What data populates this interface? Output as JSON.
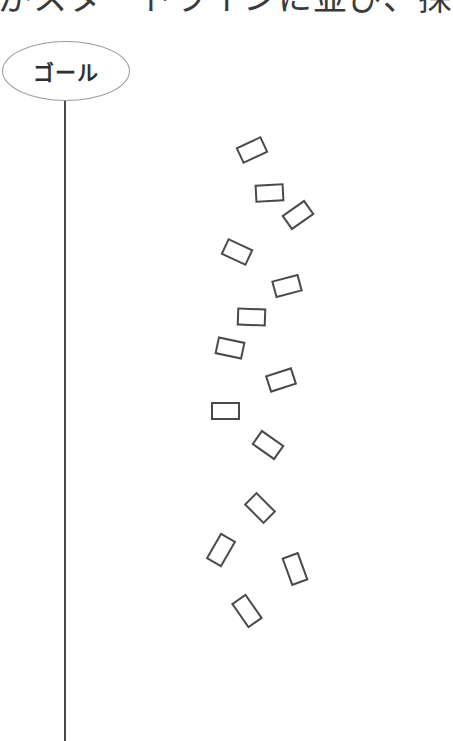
{
  "heading": {
    "text": "がスタートラインに並び、探"
  },
  "goal": {
    "label": "ゴール"
  },
  "colors": {
    "stroke": "#4a4a4a",
    "ellipse_stroke": "#9a9a9a",
    "text": "#2f2f2f"
  },
  "cards": [
    {
      "cx": 252,
      "cy": 150,
      "w": 28,
      "h": 18,
      "rot": -25
    },
    {
      "cx": 269,
      "cy": 193,
      "w": 29,
      "h": 18,
      "rot": -3
    },
    {
      "cx": 298,
      "cy": 215,
      "w": 28,
      "h": 18,
      "rot": -35
    },
    {
      "cx": 237,
      "cy": 252,
      "w": 28,
      "h": 18,
      "rot": 25
    },
    {
      "cx": 287,
      "cy": 286,
      "w": 28,
      "h": 18,
      "rot": -15
    },
    {
      "cx": 251,
      "cy": 317,
      "w": 29,
      "h": 18,
      "rot": 2
    },
    {
      "cx": 230,
      "cy": 348,
      "w": 28,
      "h": 18,
      "rot": 12
    },
    {
      "cx": 281,
      "cy": 380,
      "w": 28,
      "h": 18,
      "rot": -18
    },
    {
      "cx": 225,
      "cy": 411,
      "w": 29,
      "h": 18,
      "rot": 0
    },
    {
      "cx": 268,
      "cy": 445,
      "w": 28,
      "h": 18,
      "rot": 35
    },
    {
      "cx": 260,
      "cy": 508,
      "w": 28,
      "h": 18,
      "rot": 45
    },
    {
      "cx": 221,
      "cy": 550,
      "w": 18,
      "h": 30,
      "rot": 30
    },
    {
      "cx": 295,
      "cy": 569,
      "w": 18,
      "h": 30,
      "rot": -20
    },
    {
      "cx": 247,
      "cy": 611,
      "w": 18,
      "h": 30,
      "rot": -35
    }
  ]
}
